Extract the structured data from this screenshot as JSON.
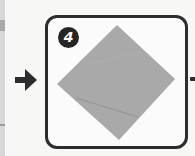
{
  "step": {
    "number": "4",
    "badge_color": "#262626",
    "border_color": "#2d2d2d"
  },
  "paper": {
    "shape": "diamond",
    "fill_color": "#a9a9a9",
    "crease_color": "#8e8e8e"
  },
  "arrows": {
    "incoming": "right-arrow-icon",
    "outgoing": "right-arrow-icon"
  }
}
